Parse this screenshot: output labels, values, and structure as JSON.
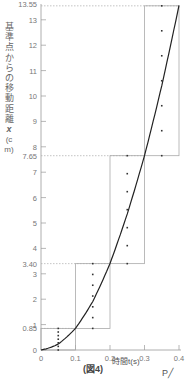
{
  "figure": {
    "caption": "(図4)",
    "corner_mark": "P"
  },
  "chart_data": {
    "type": "line",
    "title": "",
    "caption": "(図4)",
    "xlabel": "時間 t (s)",
    "ylabel": "基準点からの移動距離 x (cm)",
    "xlim": [
      0,
      0.4
    ],
    "ylim": [
      0,
      13.55
    ],
    "x_ticks": [
      0,
      0.1,
      0.2,
      0.3,
      0.4
    ],
    "x_tick_labels": [
      "0",
      "0.1",
      "0.2",
      "0.3",
      "0.4"
    ],
    "y_ticks": [
      0,
      1,
      2,
      3,
      4,
      5,
      6,
      7,
      8,
      9,
      10,
      11,
      12,
      13
    ],
    "y_tick_labels": [
      "0",
      "1",
      "2",
      "3",
      "4",
      "5",
      "6",
      "7",
      "8",
      "9",
      "10",
      "11",
      "12",
      "13"
    ],
    "y_reference_lines": [
      {
        "value": 0.85,
        "label": "0.85"
      },
      {
        "value": 3.4,
        "label": "3.40"
      },
      {
        "value": 7.65,
        "label": "7.65"
      },
      {
        "value": 13.55,
        "label": "13.55"
      }
    ],
    "interval_boxes": [
      {
        "t_start": 0.0,
        "t_end": 0.1,
        "x_start": 0,
        "x_end": 0.85,
        "dots_at_t": 0.05
      },
      {
        "t_start": 0.1,
        "t_end": 0.2,
        "x_start": 0.85,
        "x_end": 3.4,
        "dots_at_t": 0.15
      },
      {
        "t_start": 0.2,
        "t_end": 0.3,
        "x_start": 3.4,
        "x_end": 7.65,
        "dots_at_t": 0.25
      },
      {
        "t_start": 0.3,
        "t_end": 0.4,
        "x_start": 7.65,
        "x_end": 13.55,
        "dots_at_t": 0.35
      }
    ],
    "series": [
      {
        "name": "x-t curve",
        "x": [
          0,
          0.05,
          0.1,
          0.15,
          0.2,
          0.25,
          0.3,
          0.35,
          0.4
        ],
        "values": [
          0,
          0.25,
          0.85,
          1.9,
          3.4,
          5.4,
          7.65,
          10.4,
          13.55
        ]
      }
    ],
    "grid": false,
    "legend": null
  },
  "axis": {
    "y_label_chars": "基準点からの移動距離",
    "y_label_var": "x",
    "y_label_unit": "(cm)",
    "x_label": "時間t(s)"
  }
}
